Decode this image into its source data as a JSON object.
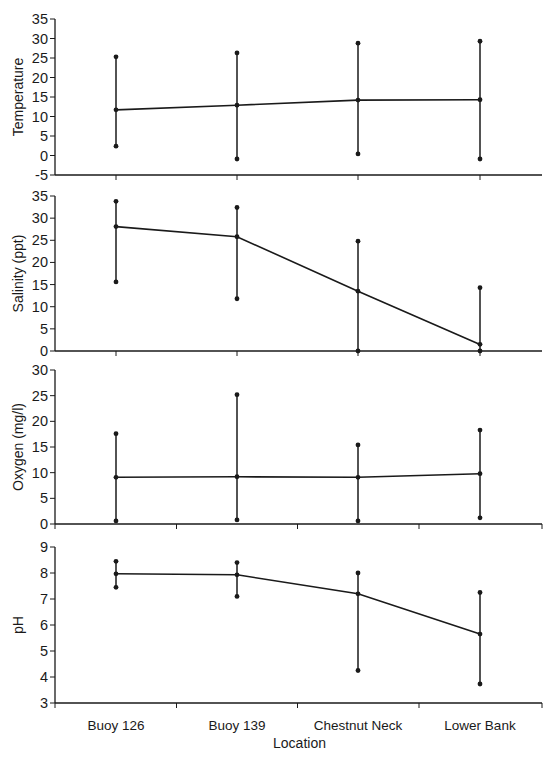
{
  "figure": {
    "xlabel": "Location",
    "categories": [
      "Buoy 126",
      "Buoy 139",
      "Chestnut Neck",
      "Lower Bank"
    ]
  },
  "chart_data": [
    {
      "type": "line",
      "title": "",
      "xlabel": "",
      "ylabel": "Temperature",
      "categories": [
        "Buoy 126",
        "Buoy 139",
        "Chestnut Neck",
        "Lower Bank"
      ],
      "series": [
        {
          "name": "mean",
          "values": [
            11.7,
            12.9,
            14.2,
            14.3
          ]
        },
        {
          "name": "max",
          "values": [
            25.3,
            26.3,
            28.8,
            29.3
          ]
        },
        {
          "name": "min",
          "values": [
            2.4,
            -0.9,
            0.4,
            -0.9
          ]
        }
      ],
      "error_bars": "min-max",
      "ylim": [
        -5,
        35
      ],
      "yticks": [
        -5,
        0,
        5,
        10,
        15,
        20,
        25,
        30,
        35
      ],
      "xtick_mode": "center",
      "grid": false
    },
    {
      "type": "line",
      "title": "",
      "xlabel": "",
      "ylabel": "Salinity (ppt)",
      "categories": [
        "Buoy 126",
        "Buoy 139",
        "Chestnut Neck",
        "Lower Bank"
      ],
      "series": [
        {
          "name": "mean",
          "values": [
            28.1,
            25.8,
            13.5,
            1.5
          ]
        },
        {
          "name": "max",
          "values": [
            33.8,
            32.4,
            24.8,
            14.3
          ]
        },
        {
          "name": "min",
          "values": [
            15.6,
            11.8,
            0.0,
            0.0
          ]
        }
      ],
      "error_bars": "min-max",
      "ylim": [
        0,
        35
      ],
      "yticks": [
        0,
        5,
        10,
        15,
        20,
        25,
        30,
        35
      ],
      "xtick_mode": "center",
      "grid": false
    },
    {
      "type": "line",
      "title": "",
      "xlabel": "",
      "ylabel": "Oxygen (mg/l)",
      "categories": [
        "Buoy 126",
        "Buoy 139",
        "Chestnut Neck",
        "Lower Bank"
      ],
      "series": [
        {
          "name": "mean",
          "values": [
            9.1,
            9.2,
            9.1,
            9.8
          ]
        },
        {
          "name": "max",
          "values": [
            17.6,
            25.2,
            15.4,
            18.3
          ]
        },
        {
          "name": "min",
          "values": [
            0.6,
            0.8,
            0.6,
            1.2
          ]
        }
      ],
      "error_bars": "min-max",
      "ylim": [
        0,
        30
      ],
      "yticks": [
        0,
        5,
        10,
        15,
        20,
        25,
        30
      ],
      "xtick_mode": "boundary",
      "grid": false
    },
    {
      "type": "line",
      "title": "",
      "xlabel": "Location",
      "ylabel": "pH",
      "categories": [
        "Buoy 126",
        "Buoy 139",
        "Chestnut Neck",
        "Lower Bank"
      ],
      "series": [
        {
          "name": "mean",
          "values": [
            7.97,
            7.93,
            7.2,
            5.65
          ]
        },
        {
          "name": "max",
          "values": [
            8.45,
            8.4,
            8.0,
            7.25
          ]
        },
        {
          "name": "min",
          "values": [
            7.45,
            7.1,
            4.25,
            3.73
          ]
        }
      ],
      "error_bars": "min-max",
      "ylim": [
        3,
        9
      ],
      "yticks": [
        3,
        4,
        5,
        6,
        7,
        8,
        9
      ],
      "xtick_mode": "boundary",
      "grid": false
    }
  ],
  "layout": {
    "x_left": 55,
    "x_right": 542,
    "category_x": [
      116,
      237,
      358,
      480
    ],
    "panels": [
      {
        "y_top": 19,
        "y_bottom": 175
      },
      {
        "y_top": 196,
        "y_bottom": 351
      },
      {
        "y_top": 370,
        "y_bottom": 524
      },
      {
        "y_top": 547,
        "y_bottom": 703
      }
    ],
    "ink_color": "#1a1a1a"
  }
}
